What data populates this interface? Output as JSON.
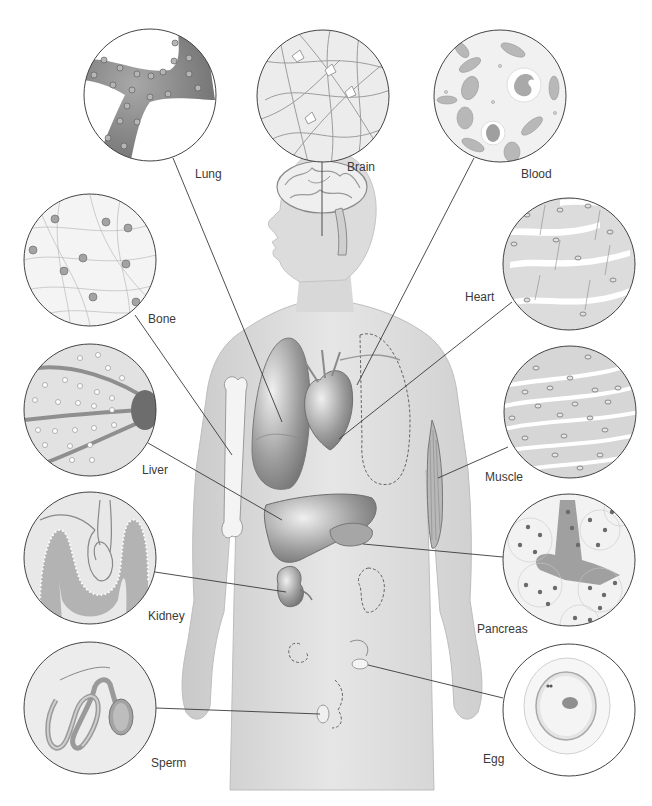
{
  "figure": {
    "background": "#ffffff",
    "body_color": "#d9d9d9",
    "line_color": "#333333"
  },
  "labels": {
    "lung": "Lung",
    "brain": "Brain",
    "blood": "Blood",
    "bone": "Bone",
    "heart": "Heart",
    "liver": "Liver",
    "muscle": "Muscle",
    "kidney": "Kidney",
    "pancreas": "Pancreas",
    "sperm": "Sperm",
    "egg": "Egg"
  },
  "insets": [
    {
      "id": "lung",
      "label": "Lung",
      "cx": 150,
      "cy": 95,
      "r": 66
    },
    {
      "id": "brain",
      "label": "Brain",
      "cx": 323,
      "cy": 96,
      "r": 66
    },
    {
      "id": "blood",
      "label": "Blood",
      "cx": 500,
      "cy": 96,
      "r": 66
    },
    {
      "id": "bone",
      "label": "Bone",
      "cx": 90,
      "cy": 260,
      "r": 66
    },
    {
      "id": "heart",
      "label": "Heart",
      "cx": 569,
      "cy": 264,
      "r": 66
    },
    {
      "id": "liver",
      "label": "Liver",
      "cx": 90,
      "cy": 410,
      "r": 66
    },
    {
      "id": "muscle",
      "label": "Muscle",
      "cx": 570,
      "cy": 412,
      "r": 66
    },
    {
      "id": "kidney",
      "label": "Kidney",
      "cx": 90,
      "cy": 558,
      "r": 66
    },
    {
      "id": "pancreas",
      "label": "Pancreas",
      "cx": 569,
      "cy": 560,
      "r": 66
    },
    {
      "id": "sperm",
      "label": "Sperm",
      "cx": 90,
      "cy": 708,
      "r": 66
    },
    {
      "id": "egg",
      "label": "Egg",
      "cx": 569,
      "cy": 710,
      "r": 66
    }
  ]
}
